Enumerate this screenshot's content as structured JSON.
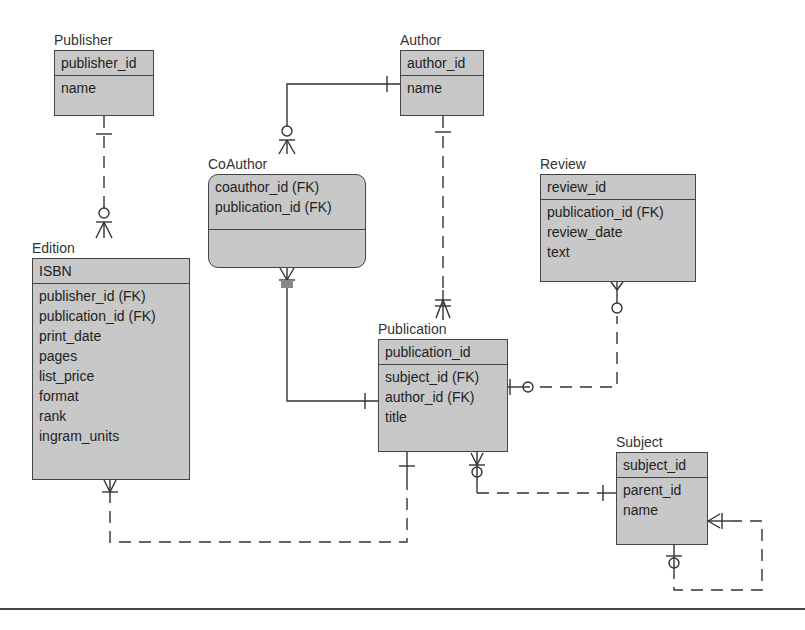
{
  "diagram": {
    "type": "entity-relationship",
    "entities": [
      {
        "name": "Publisher",
        "pk": [
          "publisher_id"
        ],
        "attrs": [
          "name"
        ]
      },
      {
        "name": "Author",
        "pk": [
          "author_id"
        ],
        "attrs": [
          "name"
        ]
      },
      {
        "name": "CoAuthor",
        "pk": [
          "coauthor_id (FK)",
          "publication_id (FK)"
        ],
        "attrs": []
      },
      {
        "name": "Edition",
        "pk": [
          "ISBN"
        ],
        "attrs": [
          "publisher_id (FK)",
          "publication_id (FK)",
          "print_date",
          "pages",
          "list_price",
          "format",
          "rank",
          "ingram_units"
        ]
      },
      {
        "name": "Review",
        "pk": [
          "review_id"
        ],
        "attrs": [
          "publication_id (FK)",
          "review_date",
          "text"
        ]
      },
      {
        "name": "Publication",
        "pk": [
          "publication_id"
        ],
        "attrs": [
          "subject_id (FK)",
          "author_id (FK)",
          "title"
        ]
      },
      {
        "name": "Subject",
        "pk": [
          "subject_id"
        ],
        "attrs": [
          "parent_id",
          "name"
        ]
      }
    ],
    "relationships": [
      {
        "from": "Publisher",
        "to": "Edition",
        "line": "dashed",
        "from_end": "one",
        "to_end": "zero-or-many"
      },
      {
        "from": "Author",
        "to": "CoAuthor",
        "line": "solid",
        "from_end": "one",
        "to_end": "zero-or-many"
      },
      {
        "from": "Author",
        "to": "Publication",
        "line": "dashed",
        "from_end": "one",
        "to_end": "one-or-many"
      },
      {
        "from": "Publication",
        "to": "CoAuthor",
        "line": "solid",
        "from_end": "one",
        "to_end": "one-or-many"
      },
      {
        "from": "Publication",
        "to": "Review",
        "line": "dashed",
        "from_end": "zero-or-one",
        "to_end": "zero-or-many"
      },
      {
        "from": "Publication",
        "to": "Edition",
        "line": "dashed",
        "from_end": "one",
        "to_end": "one-or-many"
      },
      {
        "from": "Subject",
        "to": "Publication",
        "line": "dashed",
        "from_end": "one",
        "to_end": "zero-or-many"
      },
      {
        "from": "Subject",
        "to": "Subject",
        "line": "dashed",
        "from_end": "zero-or-one",
        "to_end": "one-or-many"
      }
    ]
  },
  "colors": {
    "entity_fill": "#c8c8c8",
    "border": "#444444",
    "line": "#333333"
  }
}
